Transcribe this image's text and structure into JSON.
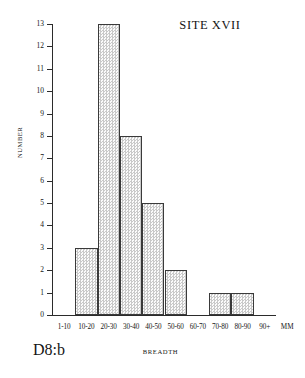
{
  "chart_data": {
    "type": "bar",
    "title": "SITE XVII",
    "xlabel": "BREADTH",
    "ylabel": "NUMBER",
    "categories": [
      "1-10",
      "10-20",
      "20-30",
      "30-40",
      "40-50",
      "50-60",
      "60-70",
      "70-80",
      "80-90",
      "90+"
    ],
    "values": [
      0,
      3,
      13,
      8,
      5,
      2,
      0,
      1,
      1,
      0
    ],
    "ylim": [
      0,
      13
    ],
    "yticks": [
      0,
      1,
      2,
      3,
      4,
      5,
      6,
      7,
      8,
      9,
      10,
      11,
      12,
      13
    ],
    "ytick_labels": [
      "0",
      "1",
      "2",
      "3",
      "4",
      "5",
      "6",
      "7",
      "8",
      "9",
      "10",
      "11",
      "12",
      "13"
    ],
    "x_unit_label": "MM",
    "grid": false,
    "legend": null,
    "bar_fill": "#f4f4f4",
    "bar_stipple": "#c9c9c9",
    "bar_edge": "#3a3a3a",
    "axis_color": "#2b2b2b"
  },
  "figure": {
    "plate_label": "D8:b"
  }
}
